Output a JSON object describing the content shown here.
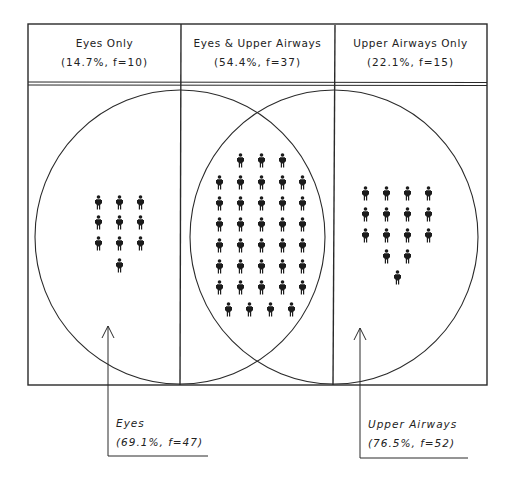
{
  "diagram": {
    "type": "venn",
    "columns": [
      {
        "id": "eyes_only",
        "title": "Eyes Only",
        "stat": "(14.7%, f=10)",
        "percent": 14.7,
        "f": 10
      },
      {
        "id": "both",
        "title": "Eyes & Upper Airways",
        "stat": "(54.4%, f=37)",
        "percent": 54.4,
        "f": 37
      },
      {
        "id": "airways_only",
        "title": "Upper Airways Only",
        "stat": "(22.1%, f=15)",
        "percent": 22.1,
        "f": 15
      }
    ],
    "sets": [
      {
        "id": "eyes",
        "label": "Eyes",
        "stat": "(69.1%, f=47)",
        "percent": 69.1,
        "f": 47
      },
      {
        "id": "upper_airways",
        "label": "Upper Airways",
        "stat": "(76.5%, f=52)",
        "percent": 76.5,
        "f": 52
      }
    ],
    "figure_icon": "person-icon",
    "colors": {
      "line": "#2a2a2a",
      "figure": "#1c1c1c",
      "background": "#ffffff"
    }
  }
}
